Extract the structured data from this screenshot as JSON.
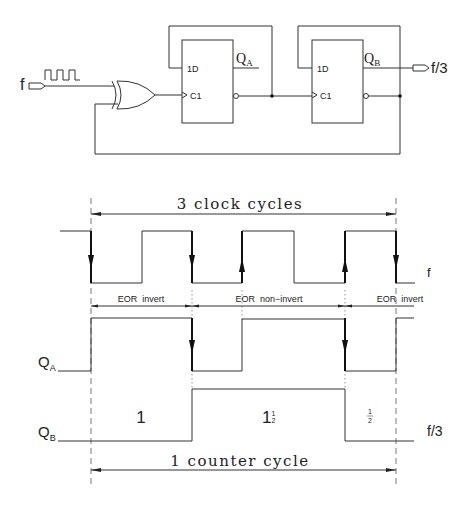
{
  "circuit": {
    "input_label": "f",
    "output_label": "f/3",
    "flipflop_a": {
      "d_label": "1D",
      "clk_label": "C1",
      "q_label": "Q",
      "q_sub": "A"
    },
    "flipflop_b": {
      "d_label": "1D",
      "clk_label": "C1",
      "q_label": "Q",
      "q_sub": "B"
    },
    "gate": "XOR (EOR)"
  },
  "timing": {
    "top_span_label": "3 clock cycles",
    "bottom_span_label": "1 counter cycle",
    "signal_f_label": "f",
    "signal_qa_label": "Q",
    "signal_qa_sub": "A",
    "signal_qb_label": "Q",
    "signal_qb_sub": "B",
    "signal_qb_out_label": "f/3",
    "phases": [
      {
        "label": "EOR  invert"
      },
      {
        "label": "EOR  non−invert"
      },
      {
        "label": "EOR  invert"
      }
    ],
    "segments": [
      {
        "label": "1"
      },
      {
        "label_main": "1",
        "label_num": "1",
        "label_den": "2"
      },
      {
        "label_num": "1",
        "label_den": "2"
      }
    ]
  }
}
